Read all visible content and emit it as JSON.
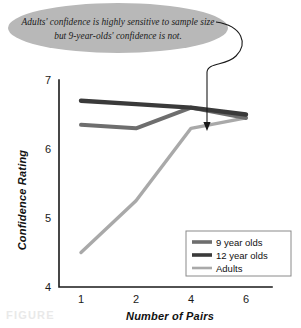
{
  "annotation": {
    "line1": "Adults' confidence is highly sensitive to sample size",
    "line2": "but 9-year-olds' confidence is not.",
    "bubble_color": "#b8b8b8",
    "pointer_target_series": "Adults",
    "pointer_target_x": "4"
  },
  "caption": {
    "ghost_text": "FIGURE"
  },
  "chart_data": {
    "type": "line",
    "title": "",
    "xlabel": "Number of Pairs",
    "ylabel": "Confidence Rating",
    "categories": [
      "1",
      "2",
      "4",
      "6"
    ],
    "xtick_labels": [
      "1",
      "2",
      "4",
      "6"
    ],
    "ytick_labels": [
      "4",
      "5",
      "6",
      "7"
    ],
    "ylim": [
      4,
      7
    ],
    "yticks": [
      4,
      5,
      6,
      7
    ],
    "grid": false,
    "legend_position": "bottom-right",
    "series": [
      {
        "name": "9 year olds",
        "color": "#6e6e6e",
        "width": 4.0,
        "values": [
          6.35,
          6.3,
          6.6,
          6.45
        ]
      },
      {
        "name": "12 year olds",
        "color": "#3a3a3a",
        "width": 4.4,
        "values": [
          6.7,
          6.65,
          6.6,
          6.5
        ]
      },
      {
        "name": "Adults",
        "color": "#a9a9a9",
        "width": 3.4,
        "values": [
          4.5,
          5.25,
          6.3,
          6.45
        ]
      }
    ]
  },
  "legend": {
    "entries": [
      {
        "label": "9 year olds",
        "color": "#6e6e6e"
      },
      {
        "label": "12 year olds",
        "color": "#3a3a3a"
      },
      {
        "label": "Adults",
        "color": "#a9a9a9"
      }
    ]
  }
}
